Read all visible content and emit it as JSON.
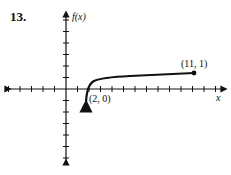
{
  "problem_number": "13.",
  "chart_data": {
    "type": "line",
    "title": "",
    "xlabel": "x",
    "ylabel": "f(x)",
    "function_shape": "logarithmic-like curve with vertical asymptote near x=2, rising quickly then flattening",
    "x_ticks_per_side": {
      "negative": 5,
      "positive": 13
    },
    "y_ticks_per_side": {
      "positive": 6,
      "negative": 6
    },
    "grid": false,
    "annotated_points": [
      {
        "label": "(2, 0)",
        "x": 2,
        "y": 0
      },
      {
        "label": "(11, 1)",
        "x": 11,
        "y": 1
      }
    ],
    "xlim": [
      -5.5,
      13.5
    ],
    "ylim": [
      -6.5,
      6.5
    ]
  }
}
